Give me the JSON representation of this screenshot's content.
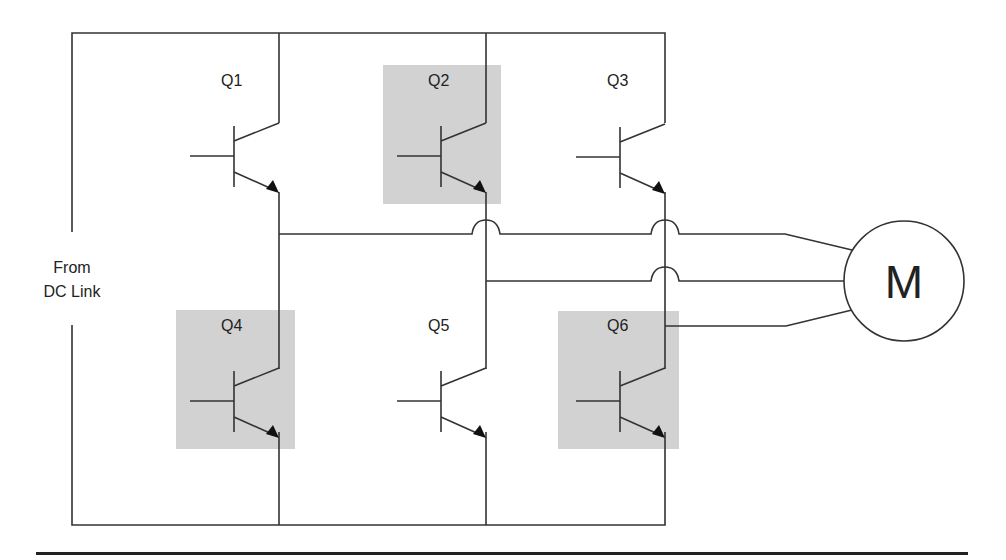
{
  "source_label": [
    "From",
    "DC Link"
  ],
  "motor_label": "M",
  "colors": {
    "wire": "#333333",
    "highlight": "#d2d2d2",
    "text": "#222222"
  },
  "transistors": [
    {
      "id": "Q1",
      "label": "Q1",
      "highlighted": false
    },
    {
      "id": "Q2",
      "label": "Q2",
      "highlighted": true
    },
    {
      "id": "Q3",
      "label": "Q3",
      "highlighted": false
    },
    {
      "id": "Q4",
      "label": "Q4",
      "highlighted": true
    },
    {
      "id": "Q5",
      "label": "Q5",
      "highlighted": false
    },
    {
      "id": "Q6",
      "label": "Q6",
      "highlighted": true
    }
  ]
}
